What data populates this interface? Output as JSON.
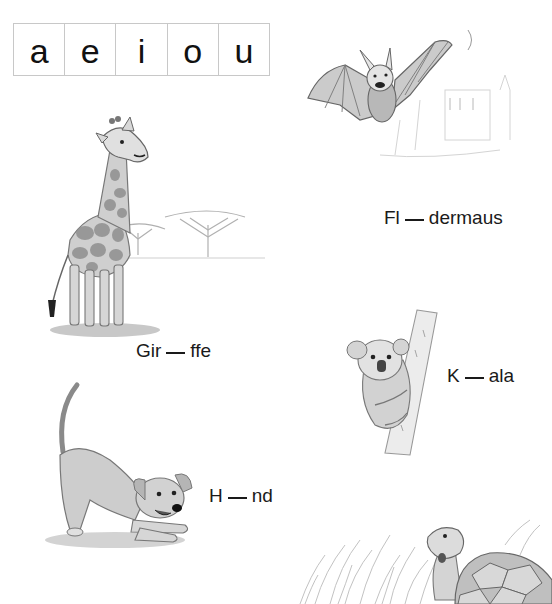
{
  "vowels": [
    "a",
    "e",
    "i",
    "o",
    "u"
  ],
  "words": {
    "giraffe": {
      "before": "Gir",
      "after": "ffe"
    },
    "bat": {
      "before": "Fl",
      "after": "dermaus"
    },
    "koala": {
      "before": "K",
      "after": "ala"
    },
    "dog": {
      "before": "H",
      "after": "nd"
    }
  },
  "illustrations": {
    "giraffe": "giraffe-with-acacia-trees",
    "bat": "flying-bat-with-castle",
    "koala": "koala-on-tree",
    "dog": "playful-dog-bowing",
    "tortoise": "tortoise-in-grass"
  },
  "colors": {
    "text": "#1a1a1a",
    "grid_border": "#c8c8c8",
    "pencil_gray": "#8a8a8a",
    "shade_gray": "#b5b5b5"
  }
}
